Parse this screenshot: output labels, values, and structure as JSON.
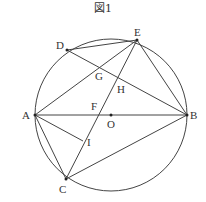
{
  "title": "図1",
  "circle": {
    "cx": 111,
    "cy": 115,
    "r": 76
  },
  "points": {
    "A": {
      "x": 35,
      "y": 115,
      "label": "A",
      "lx": 22,
      "ly": 119
    },
    "B": {
      "x": 187,
      "y": 115,
      "label": "B",
      "lx": 190,
      "ly": 119
    },
    "C": {
      "x": 66,
      "y": 179,
      "label": "C",
      "lx": 59,
      "ly": 193
    },
    "D": {
      "x": 67,
      "y": 50,
      "label": "D",
      "lx": 56,
      "ly": 49
    },
    "E": {
      "x": 137,
      "y": 40,
      "label": "E",
      "lx": 134,
      "ly": 36
    },
    "G": {
      "x": 99,
      "y": 68,
      "label": "G",
      "lx": 95,
      "ly": 80
    },
    "H": {
      "x": 118,
      "y": 80,
      "label": "H",
      "lx": 117,
      "ly": 93
    },
    "F": {
      "x": 97,
      "y": 115,
      "label": "F",
      "lx": 91,
      "ly": 110
    },
    "O": {
      "x": 111,
      "y": 115,
      "label": "O",
      "lx": 107,
      "ly": 128
    },
    "I": {
      "x": 83,
      "y": 141,
      "label": "I",
      "lx": 87,
      "ly": 146
    }
  },
  "segments": [
    [
      "D",
      "E"
    ],
    [
      "D",
      "B"
    ],
    [
      "E",
      "A"
    ],
    [
      "E",
      "C"
    ],
    [
      "E",
      "B"
    ],
    [
      "A",
      "B"
    ],
    [
      "A",
      "I"
    ],
    [
      "A",
      "C"
    ],
    [
      "C",
      "B"
    ]
  ]
}
